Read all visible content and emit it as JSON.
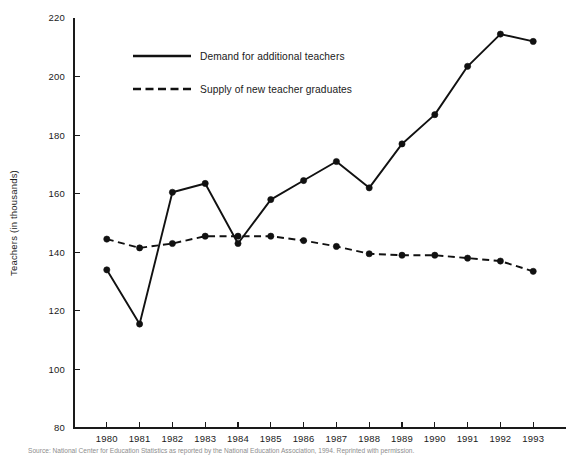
{
  "chart_data": {
    "type": "line",
    "title": "",
    "xlabel": "",
    "ylabel": "Teachers (in thousands)",
    "categories": [
      "1980",
      "1981",
      "1982",
      "1983",
      "1984",
      "1985",
      "1986",
      "1987",
      "1988",
      "1989",
      "1990",
      "1991",
      "1992",
      "1993"
    ],
    "ylim": [
      80,
      220
    ],
    "yticks": [
      80,
      100,
      120,
      140,
      160,
      180,
      200,
      220
    ],
    "ytick_labels": [
      "80",
      "100",
      "120",
      "140",
      "160",
      "180",
      "200",
      "220"
    ],
    "grid": false,
    "legend_position": "top-center",
    "series": [
      {
        "name": "Demand for additional teachers",
        "style": "solid",
        "marker": "filled-circle",
        "color": "#111111",
        "values": [
          134,
          115.5,
          160.5,
          163.5,
          143,
          158,
          164.5,
          171,
          162,
          177,
          187,
          203.5,
          214.5,
          212
        ]
      },
      {
        "name": "Supply of new teacher graduates",
        "style": "dashed",
        "marker": "filled-circle",
        "color": "#111111",
        "values": [
          144.5,
          141.5,
          143,
          145.5,
          145.5,
          145.5,
          144,
          142,
          139.5,
          139,
          139,
          138,
          137,
          133.5
        ]
      }
    ]
  },
  "legend": {
    "entries": [
      {
        "label": "Demand for additional teachers"
      },
      {
        "label": "Supply of new teacher graduates"
      }
    ]
  },
  "axes": {
    "y_title": "Teachers (in thousands)"
  },
  "footer": {
    "source": "Source: National Center for Education Statistics as reported by the National Education Association, 1994. Reprinted with permission."
  }
}
